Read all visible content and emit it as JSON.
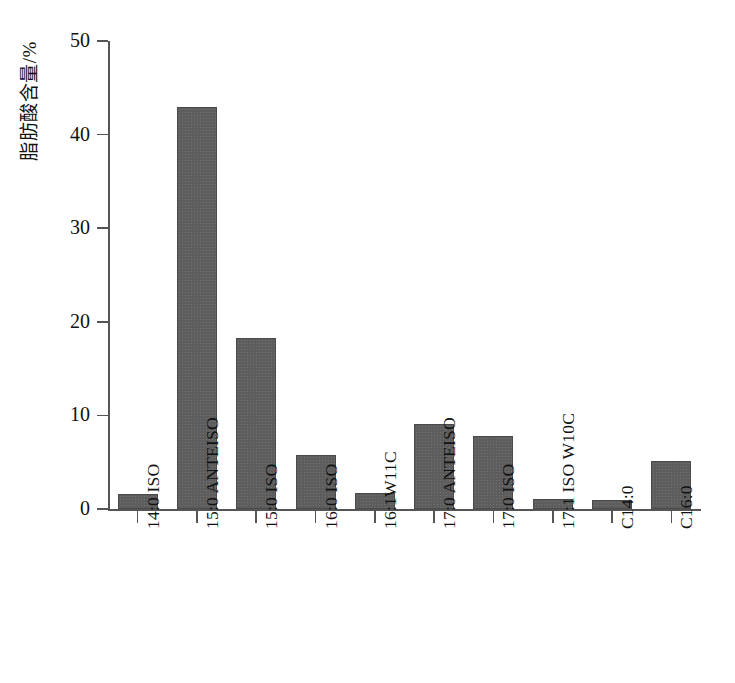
{
  "chart_data": {
    "type": "bar",
    "title": "",
    "subtitle": "",
    "xlabel": "",
    "ylabel": "脂肪酸含量/%",
    "ylim": [
      0,
      50
    ],
    "yticks": [
      0,
      10,
      20,
      30,
      40,
      50
    ],
    "ytick_labels": [
      "0",
      "10",
      "20",
      "30",
      "40",
      "50"
    ],
    "grid": false,
    "legend": null,
    "legend_position": "none",
    "bar_color": "#5d5d5d",
    "bar_edge_color": "#4a4a4a",
    "axis_color": "#555555",
    "categories": [
      "14:0 ISO",
      "15:0 ANTEISO",
      "15:0 ISO",
      "16:0 ISO",
      "16:1W11C",
      "17:0 ANTEISO",
      "17:0 ISO",
      "17:1 ISO W10C",
      "C14:0",
      "C16:0"
    ],
    "values": [
      1.6,
      42.9,
      18.3,
      5.8,
      1.7,
      9.1,
      7.8,
      1.1,
      1.0,
      5.1
    ],
    "annotations": []
  }
}
